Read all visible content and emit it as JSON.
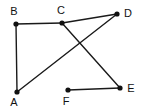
{
  "figure": {
    "type": "graph-diagram",
    "width": 148,
    "height": 110,
    "background_color": "#ffffff",
    "line_color": "#1a1a1a",
    "vertex_color": "#111111",
    "label_color": "#111111"
  },
  "vertices": [
    {
      "id": "A",
      "label": "A",
      "x": 17,
      "y": 92,
      "label_x": 14,
      "label_y": 103
    },
    {
      "id": "B",
      "label": "B",
      "x": 16,
      "y": 24,
      "label_x": 14,
      "label_y": 12
    },
    {
      "id": "C",
      "label": "C",
      "x": 62,
      "y": 23,
      "label_x": 61,
      "label_y": 11
    },
    {
      "id": "D",
      "label": "D",
      "x": 117,
      "y": 14,
      "label_x": 128,
      "label_y": 14
    },
    {
      "id": "E",
      "label": "E",
      "x": 120,
      "y": 88,
      "label_x": 131,
      "label_y": 89
    },
    {
      "id": "F",
      "label": "F",
      "x": 68,
      "y": 90,
      "label_x": 66,
      "label_y": 102
    }
  ],
  "edges": [
    {
      "id": "edge-b-c",
      "from": "B",
      "to": "C",
      "x1": 16,
      "y1": 24,
      "x2": 62,
      "y2": 23
    },
    {
      "id": "edge-c-d",
      "from": "C",
      "to": "D",
      "x1": 62,
      "y1": 23,
      "x2": 117,
      "y2": 14
    },
    {
      "id": "edge-b-a",
      "from": "B",
      "to": "A",
      "x1": 16,
      "y1": 24,
      "x2": 17,
      "y2": 92
    },
    {
      "id": "edge-a-d",
      "from": "A",
      "to": "D",
      "x1": 17,
      "y1": 92,
      "x2": 117,
      "y2": 14
    },
    {
      "id": "edge-c-e",
      "from": "C",
      "to": "E",
      "x1": 62,
      "y1": 23,
      "x2": 120,
      "y2": 88
    },
    {
      "id": "edge-f-e",
      "from": "F",
      "to": "E",
      "x1": 68,
      "y1": 90,
      "x2": 120,
      "y2": 88
    }
  ],
  "crossings": [
    {
      "id": "crossing-ad-ce",
      "x": 73,
      "y": 43
    }
  ]
}
